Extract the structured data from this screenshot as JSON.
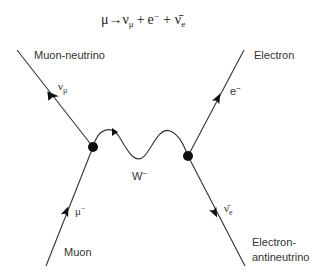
{
  "equation": {
    "lhs": "μ",
    "arrow": "→",
    "p1": "ν",
    "p1_sub": "μ",
    "plus1": "+",
    "p2": "e",
    "p2_sup": "−",
    "plus2": "+",
    "p3": "ν̄",
    "p3_sub": "e"
  },
  "particles": {
    "muon_neutrino": {
      "name": "Muon-neutrino",
      "symbol": "ν",
      "sub": "μ"
    },
    "electron": {
      "name": "Electron",
      "symbol": "e",
      "sup": "−"
    },
    "muon": {
      "name": "Muon",
      "symbol": "μ",
      "sup": "−"
    },
    "electron_antineutrino": {
      "name_line1": "Electron-",
      "name_line2": "antineutrino",
      "symbol": "ν̄",
      "sub": "e"
    },
    "w_boson": {
      "symbol": "W",
      "sup": "−"
    }
  },
  "colors": {
    "line": "#333333",
    "vertex": "#111111",
    "background": "#ffffff"
  }
}
